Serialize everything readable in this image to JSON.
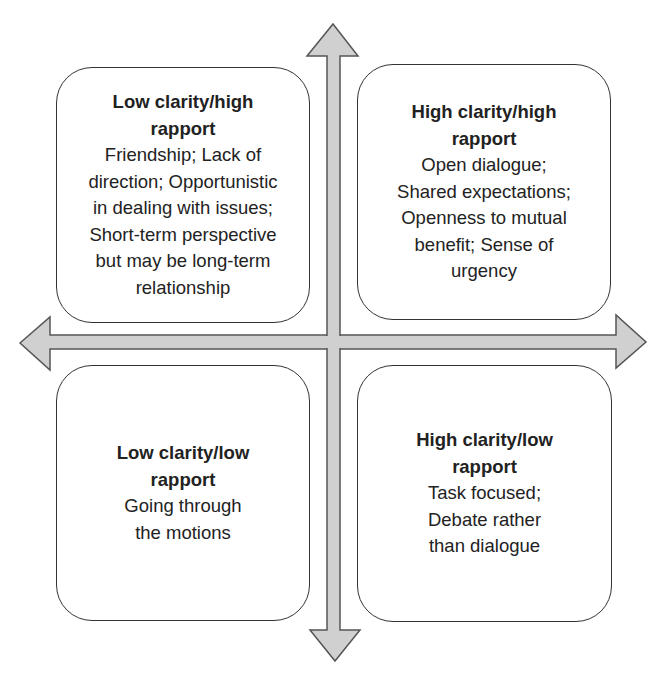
{
  "diagram": {
    "type": "2x2 quadrant matrix",
    "axes": {
      "horizontal": "double-headed arrow (clarity: low to high, left to right)",
      "vertical": "double-headed arrow (rapport: low to high, bottom to top)"
    },
    "colors": {
      "arrow_fill": "#d0d0d0",
      "arrow_stroke": "#555555",
      "box_border": "#333333",
      "text": "#222222",
      "background": "#ffffff"
    },
    "quadrants": {
      "top_left": {
        "title_lines": [
          "Low clarity/high",
          "rapport"
        ],
        "desc_lines": [
          "Friendship; Lack of",
          "direction; Opportunistic",
          "in dealing with issues;",
          "Short-term perspective",
          "but may be long-term",
          "relationship"
        ]
      },
      "top_right": {
        "title_lines": [
          "High clarity/high",
          "rapport"
        ],
        "desc_lines": [
          "Open dialogue;",
          "Shared expectations;",
          "Openness to mutual",
          "benefit; Sense of",
          "urgency"
        ]
      },
      "bottom_left": {
        "title_lines": [
          "Low clarity/low",
          "rapport"
        ],
        "desc_lines": [
          "Going through",
          "the motions"
        ]
      },
      "bottom_right": {
        "title_lines": [
          "High clarity/low",
          "rapport"
        ],
        "desc_lines": [
          "Task focused;",
          "Debate rather",
          "than dialogue"
        ]
      }
    }
  }
}
